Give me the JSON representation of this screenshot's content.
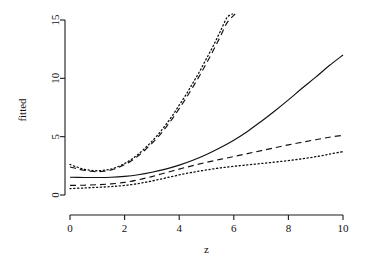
{
  "chart_data": {
    "type": "line",
    "title": "",
    "xlabel": "z",
    "ylabel": "fitted",
    "xlim": [
      -0.35,
      10.6
    ],
    "ylim": [
      -0.35,
      15.6
    ],
    "xticks": [
      0,
      2,
      4,
      6,
      8,
      10
    ],
    "xtick_labels": [
      "0",
      "2",
      "4",
      "6",
      "8",
      "10"
    ],
    "yticks": [
      0,
      5,
      10,
      15
    ],
    "ytick_labels": [
      "0",
      "5",
      "10",
      "15"
    ],
    "grid": false,
    "legend": "none",
    "series": [
      {
        "name": "solid",
        "style": "solid",
        "x": [
          0,
          0.5,
          1,
          1.5,
          2,
          2.5,
          3,
          3.5,
          4,
          4.5,
          5,
          5.5,
          6,
          6.5,
          7,
          7.5,
          8,
          8.5,
          9,
          9.5,
          10
        ],
        "values": [
          1.52,
          1.5,
          1.5,
          1.52,
          1.6,
          1.74,
          1.95,
          2.22,
          2.56,
          2.98,
          3.48,
          4.05,
          4.7,
          5.45,
          6.3,
          7.2,
          8.15,
          9.15,
          10.1,
          11.1,
          12.0
        ]
      },
      {
        "name": "dashed-lower",
        "style": "dashed",
        "x": [
          0,
          0.5,
          1,
          1.5,
          2,
          2.5,
          3,
          3.5,
          4,
          4.5,
          5,
          5.5,
          6,
          6.5,
          7,
          7.5,
          8,
          8.5,
          9,
          9.5,
          10
        ],
        "values": [
          0.82,
          0.84,
          0.88,
          0.95,
          1.08,
          1.3,
          1.58,
          1.9,
          2.22,
          2.52,
          2.8,
          3.05,
          3.3,
          3.55,
          3.8,
          4.05,
          4.3,
          4.52,
          4.74,
          4.95,
          5.12
        ]
      },
      {
        "name": "dotted-lower",
        "style": "dotted",
        "x": [
          0,
          0.5,
          1,
          1.5,
          2,
          2.5,
          3,
          3.5,
          4,
          4.5,
          5,
          5.5,
          6,
          6.5,
          7,
          7.5,
          8,
          8.5,
          9,
          9.5,
          10
        ],
        "values": [
          0.55,
          0.6,
          0.66,
          0.72,
          0.82,
          0.98,
          1.2,
          1.46,
          1.72,
          1.95,
          2.15,
          2.32,
          2.46,
          2.58,
          2.7,
          2.82,
          2.95,
          3.1,
          3.28,
          3.5,
          3.72
        ]
      },
      {
        "name": "dotted-steep",
        "style": "dotted",
        "x": [
          0,
          0.25,
          0.5,
          0.75,
          1,
          1.25,
          1.5,
          1.75,
          2,
          2.25,
          2.5,
          2.75,
          3,
          3.25,
          3.5,
          3.75,
          4,
          4.25,
          4.5,
          4.75,
          5,
          5.25,
          5.5,
          5.75,
          5.95
        ],
        "values": [
          2.62,
          2.4,
          2.22,
          2.12,
          2.08,
          2.12,
          2.22,
          2.42,
          2.7,
          3.05,
          3.5,
          4.02,
          4.6,
          5.25,
          6.0,
          6.8,
          7.7,
          8.6,
          9.6,
          10.6,
          11.7,
          12.8,
          14.0,
          15.2,
          15.6
        ]
      },
      {
        "name": "dashed-steep",
        "style": "dashed",
        "x": [
          0,
          0.25,
          0.5,
          0.75,
          1,
          1.25,
          1.5,
          1.75,
          2,
          2.25,
          2.5,
          2.75,
          3,
          3.25,
          3.5,
          3.75,
          4,
          4.25,
          4.5,
          4.75,
          5,
          5.25,
          5.5,
          5.75,
          6.05
        ],
        "values": [
          2.4,
          2.26,
          2.12,
          2.04,
          2.0,
          2.04,
          2.14,
          2.34,
          2.6,
          2.94,
          3.36,
          3.86,
          4.42,
          5.05,
          5.76,
          6.54,
          7.4,
          8.3,
          9.25,
          10.25,
          11.3,
          12.4,
          13.55,
          14.75,
          15.6
        ]
      }
    ]
  },
  "geometry": {
    "plot_left": 65,
    "plot_right": 357,
    "plot_top": 14,
    "plot_bottom": 215,
    "x0_px": 70,
    "x10_px": 343,
    "y0_px": 195,
    "y15_px": 20
  },
  "colors": {
    "ink": "#111111",
    "background": "#ffffff"
  }
}
